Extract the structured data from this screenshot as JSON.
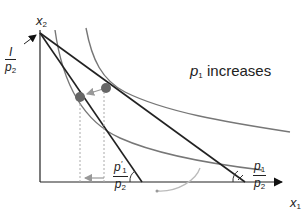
{
  "diagram": {
    "axes": {
      "x_label": "x",
      "x_sub": "1",
      "y_label": "x",
      "y_sub": "2"
    },
    "intercept_label": {
      "numerator": "I",
      "denominator_var": "p",
      "denominator_sub": "2"
    },
    "annotation": {
      "var": "p",
      "sub": "1",
      "text": " increases"
    },
    "slope_original": {
      "num_var": "p",
      "num_sub": "1",
      "den_var": "p",
      "den_sub": "2"
    },
    "slope_new": {
      "num_var": "p",
      "num_sub": "1",
      "num_prime": "′",
      "den_var": "p",
      "den_sub": "2"
    },
    "colors": {
      "budget_line": "#222222",
      "indifference_curve": "#777777",
      "point": "#666666",
      "arrow": "#999999",
      "guide": "#aaaaaa"
    }
  }
}
